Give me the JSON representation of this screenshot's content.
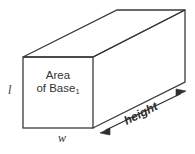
{
  "figure": {
    "name": "rectangular-prism-volume-diagram",
    "background_color": "#ffffff",
    "stroke_color": "#3a3a3a",
    "text_color": "#333333",
    "labels": {
      "base_area_line1": "Area",
      "base_area_line2": "of Base",
      "base_area_subscript": "1",
      "length": "l",
      "width": "w",
      "height": "height"
    }
  }
}
